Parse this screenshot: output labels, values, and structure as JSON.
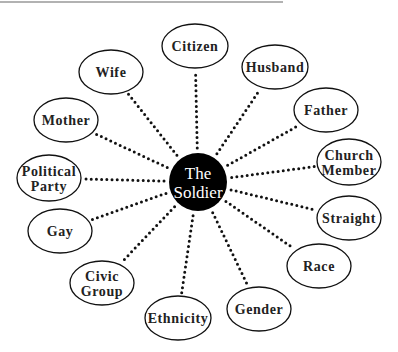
{
  "diagram": {
    "center": {
      "lines": [
        "The",
        "Soldier"
      ],
      "x": 198,
      "y": 182,
      "r": 29,
      "fill": "#000000",
      "text_color": "#ffffff"
    },
    "top_rule": {
      "x1": 0,
      "x2": 283,
      "y": 2,
      "color": "#999999"
    },
    "nodes": [
      {
        "id": "citizen",
        "lines": [
          "Citizen"
        ],
        "x": 195,
        "y": 46,
        "rx": 33,
        "ry": 22
      },
      {
        "id": "wife",
        "lines": [
          "Wife"
        ],
        "x": 111,
        "y": 72,
        "rx": 32,
        "ry": 22
      },
      {
        "id": "husband",
        "lines": [
          "Husband"
        ],
        "x": 275,
        "y": 67,
        "rx": 33,
        "ry": 22
      },
      {
        "id": "mother",
        "lines": [
          "Mother"
        ],
        "x": 66,
        "y": 120,
        "rx": 32,
        "ry": 22
      },
      {
        "id": "father",
        "lines": [
          "Father"
        ],
        "x": 326,
        "y": 110,
        "rx": 32,
        "ry": 22
      },
      {
        "id": "political-party",
        "lines": [
          "Political",
          "Party"
        ],
        "x": 49,
        "y": 178,
        "rx": 32,
        "ry": 23
      },
      {
        "id": "church-member",
        "lines": [
          "Church",
          "Member"
        ],
        "x": 349,
        "y": 162,
        "rx": 32,
        "ry": 23
      },
      {
        "id": "gay",
        "lines": [
          "Gay"
        ],
        "x": 60,
        "y": 231,
        "rx": 32,
        "ry": 22
      },
      {
        "id": "straight",
        "lines": [
          "Straight"
        ],
        "x": 349,
        "y": 218,
        "rx": 32,
        "ry": 22
      },
      {
        "id": "civic-group",
        "lines": [
          "Civic",
          "Group"
        ],
        "x": 102,
        "y": 283,
        "rx": 32,
        "ry": 22
      },
      {
        "id": "race",
        "lines": [
          "Race"
        ],
        "x": 319,
        "y": 266,
        "rx": 32,
        "ry": 22
      },
      {
        "id": "ethnicity",
        "lines": [
          "Ethnicity"
        ],
        "x": 178,
        "y": 318,
        "rx": 33,
        "ry": 22
      },
      {
        "id": "gender",
        "lines": [
          "Gender"
        ],
        "x": 259,
        "y": 309,
        "rx": 32,
        "ry": 22
      }
    ],
    "connector_style": {
      "color": "#111111",
      "style": "dotted",
      "width": 3
    }
  }
}
